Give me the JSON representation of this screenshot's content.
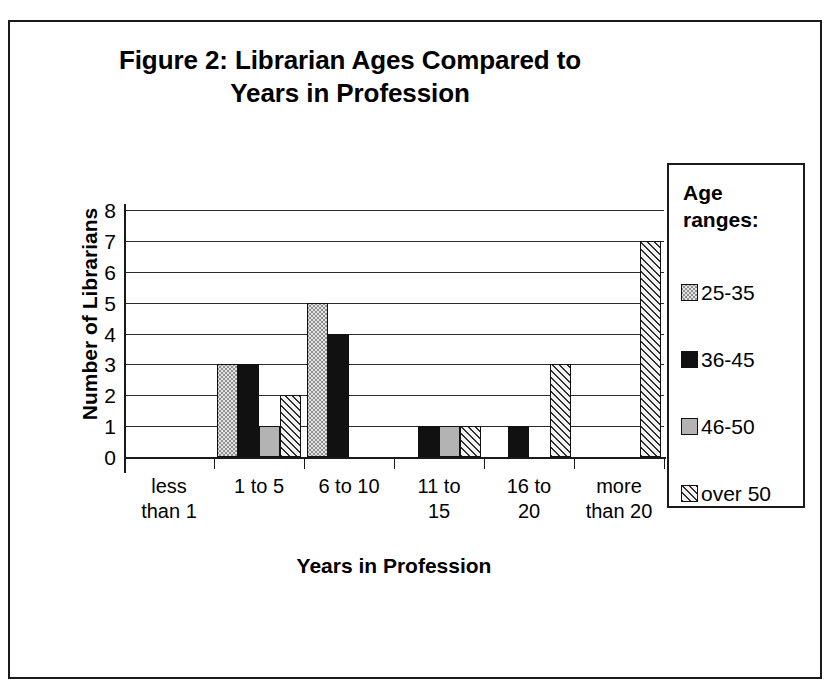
{
  "figure": {
    "title": "Figure 2:  Librarian Ages Compared to\nYears in Profession"
  },
  "legend": {
    "title": "Age\nranges:",
    "items": [
      {
        "label": "25-35",
        "pattern": "light-dotted",
        "color": "#e3e3e3"
      },
      {
        "label": "36-45",
        "pattern": "solid-black",
        "color": "#111111"
      },
      {
        "label": "46-50",
        "pattern": "solid-gray",
        "color": "#b3b3b3"
      },
      {
        "label": "over 50",
        "pattern": "diagonal-hatch",
        "color": "#f2f2f2"
      }
    ]
  },
  "chart_data": {
    "type": "bar",
    "title": "Figure 2:  Librarian Ages Compared to Years in Profession",
    "xlabel": "Years in Profession",
    "ylabel": "Number of Librarians",
    "categories": [
      "less\nthan 1",
      "1 to 5",
      "6 to 10",
      "11 to\n15",
      "16 to\n20",
      "more\nthan 20"
    ],
    "series": [
      {
        "name": "25-35",
        "values": [
          0,
          3,
          5,
          0,
          0,
          0
        ]
      },
      {
        "name": "36-45",
        "values": [
          0,
          3,
          4,
          1,
          1,
          0
        ]
      },
      {
        "name": "46-50",
        "values": [
          0,
          1,
          0,
          1,
          0,
          0
        ]
      },
      {
        "name": "over 50",
        "values": [
          0,
          2,
          0,
          1,
          3,
          7
        ]
      }
    ],
    "ylim": [
      0,
      8
    ],
    "yticks": [
      0,
      1,
      2,
      3,
      4,
      5,
      6,
      7,
      8
    ],
    "ytick_labels": [
      "0",
      "1",
      "2",
      "3",
      "4",
      "5",
      "6",
      "7",
      "8"
    ],
    "grid": true,
    "legend_position": "right",
    "legend_title": "Age ranges:"
  }
}
